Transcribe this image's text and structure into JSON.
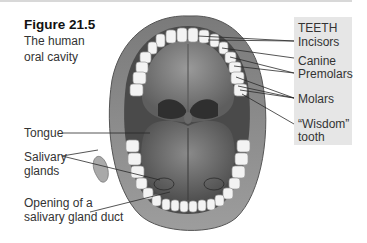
{
  "figure": {
    "number": "Figure 21.5",
    "caption_line1": "The human",
    "caption_line2": "oral cavity"
  },
  "teeth_legend": {
    "heading": "TEETH",
    "labels": [
      "Incisors",
      "Canine",
      "Premolars",
      "Molars",
      "“Wisdom”",
      "tooth"
    ]
  },
  "left_labels": {
    "tongue": "Tongue",
    "salivary_line1": "Salivary",
    "salivary_line2": "glands",
    "duct_line1": "Opening of a",
    "duct_line2": "salivary gland duct"
  },
  "colors": {
    "legend_bg": "#e6e6e6",
    "leader_line": "#2a2a2a",
    "lip": "#8a8a8a",
    "palate": "#7d7d7d",
    "tongue": "#6f6f6f",
    "teeth": "#f2f2f2"
  }
}
